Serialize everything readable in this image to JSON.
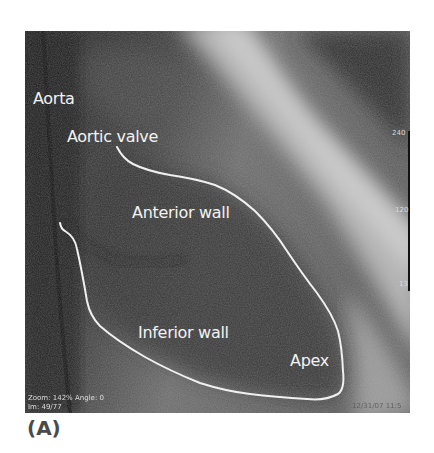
{
  "figure": {
    "panel_label": "(A)",
    "image_type": "left-ventriculogram",
    "anatomy_labels": {
      "aorta": "Aorta",
      "aortic_valve": "Aortic valve",
      "anterior_wall": "Anterior wall",
      "inferior_wall": "Inferior wall",
      "apex": "Apex"
    },
    "overlay": {
      "zoom_angle": "Zoom: 142% Angle: 0",
      "image_index": "Im: 49/77",
      "date_time": "12/31/07 11:5"
    },
    "scale": {
      "top": "240",
      "middle": "120",
      "bottom": "13"
    },
    "colors": {
      "outline": "#f0f0f0",
      "label_text": "#f2f2f2",
      "panel_label": "#4a4a4a"
    }
  }
}
